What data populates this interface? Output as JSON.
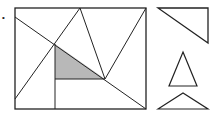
{
  "diagram": {
    "label_dot": "•",
    "stroke": "#222222",
    "fill_shaded": "#b8b8b8",
    "rectangle": {
      "x1": 15,
      "y1": 8,
      "x2": 146,
      "y2": 109
    },
    "shaded_triangle": {
      "points": "55,44 55,79 105,79"
    },
    "pieces": [
      "right-triangle",
      "isosceles-triangle",
      "obtuse-triangle"
    ]
  }
}
